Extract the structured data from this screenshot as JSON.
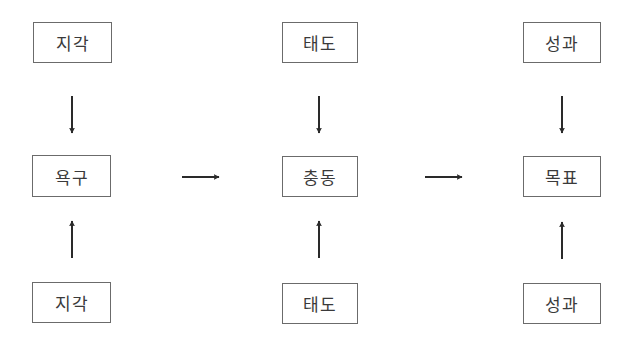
{
  "diagram": {
    "colors": {
      "border": "#6b6b6b",
      "text": "#3a3a3a",
      "arrow": "#2a2a2a",
      "background": "#ffffff"
    },
    "columns": [
      {
        "top": {
          "label": "지각"
        },
        "center": {
          "label": "욕구"
        },
        "bottom": {
          "label": "지각"
        }
      },
      {
        "top": {
          "label": "태도"
        },
        "center": {
          "label": "충동"
        },
        "bottom": {
          "label": "태도"
        }
      },
      {
        "top": {
          "label": "성과"
        },
        "center": {
          "label": "목표"
        },
        "bottom": {
          "label": "성과"
        }
      }
    ],
    "edges": [
      {
        "from": "지각",
        "to": "욕구",
        "direction": "down"
      },
      {
        "from": "지각",
        "to": "욕구",
        "direction": "up"
      },
      {
        "from": "태도",
        "to": "충동",
        "direction": "down"
      },
      {
        "from": "태도",
        "to": "충동",
        "direction": "up"
      },
      {
        "from": "성과",
        "to": "목표",
        "direction": "down"
      },
      {
        "from": "성과",
        "to": "목표",
        "direction": "up"
      },
      {
        "from": "욕구",
        "to": "충동",
        "direction": "right"
      },
      {
        "from": "충동",
        "to": "목표",
        "direction": "right"
      }
    ]
  }
}
